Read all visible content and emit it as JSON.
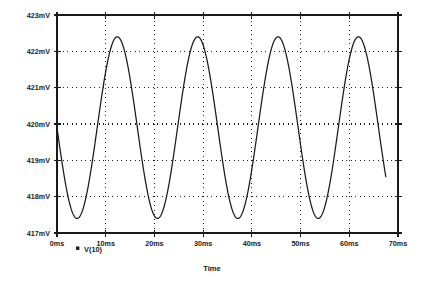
{
  "chart_data": {
    "type": "line",
    "title": "",
    "xlabel": "Time",
    "ylabel": "",
    "xlim": [
      0,
      70
    ],
    "ylim": [
      417,
      423
    ],
    "x_unit": "ms",
    "y_unit": "mV",
    "grid": true,
    "grid_style": "dotted",
    "legend_position": "bottom-left",
    "legend": [
      {
        "name": "V(10)",
        "marker": "square",
        "color": "#1a1a1a"
      }
    ],
    "x_tick_labels": [
      "0ms",
      "10ms",
      "20ms",
      "30ms",
      "40ms",
      "50ms",
      "60ms",
      "70ms"
    ],
    "x_tick_values": [
      0,
      10,
      20,
      30,
      40,
      50,
      60,
      70
    ],
    "y_tick_labels": [
      "417mV",
      "418mV",
      "419mV",
      "420mV",
      "421mV",
      "422mV",
      "423mV"
    ],
    "y_tick_values": [
      417,
      418,
      419,
      420,
      421,
      422,
      423
    ],
    "series": [
      {
        "name": "V(10)",
        "color": "#1a1a1a",
        "waveform": "sine",
        "offset_mV": 419.9,
        "amplitude_mV": 2.5,
        "period_ms": 16.5,
        "phase_deg": 180,
        "start_value_mV": 420.0,
        "peak_value_mV": 422.4,
        "trough_value_mV": 417.4,
        "peak_times_ms": [
          12.9,
          29.4,
          45.9,
          62.4
        ],
        "trough_times_ms": [
          4.6,
          21.1,
          37.6,
          54.1
        ],
        "x_end_ms": 67.5,
        "end_value_mV": 420.0
      }
    ]
  },
  "axis_titles": {
    "x": "Time"
  },
  "legend_entry": {
    "label": "V(10)"
  }
}
